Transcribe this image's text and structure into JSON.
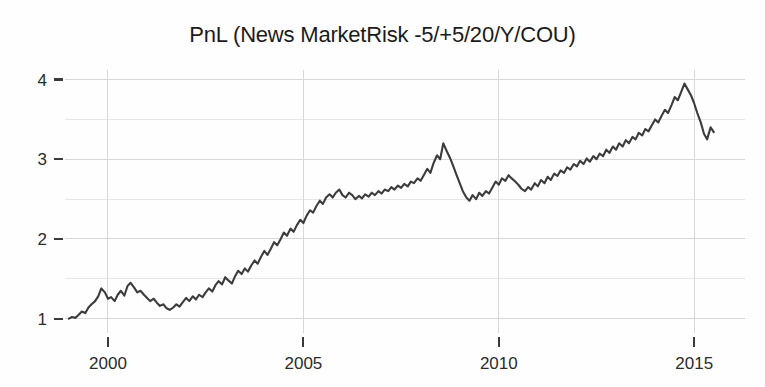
{
  "chart_data": {
    "type": "line",
    "title": "PnL (News MarketRisk -5/+5/20/Y/COU)",
    "xlabel": "",
    "ylabel": "",
    "xlim": [
      1998.9,
      2016.3
    ],
    "ylim": [
      0.82,
      4.12
    ],
    "xticks": [
      2000,
      2005,
      2010,
      2015
    ],
    "xticklabels": [
      "2000",
      "2005",
      "2010",
      "2015"
    ],
    "yticks": [
      1,
      2,
      3,
      4
    ],
    "yticklabels": [
      "1",
      "2",
      "3",
      "4"
    ],
    "minor_yticks": [
      1.5,
      2.5,
      3.5
    ],
    "grid": true,
    "grid_color": "#d8d8d8",
    "line_color": "#3c3c3c",
    "background_color": "#fefefe",
    "legend": null,
    "series": [
      {
        "name": "PnL",
        "x": [
          1999.0,
          1999.08,
          1999.17,
          1999.25,
          1999.33,
          1999.42,
          1999.5,
          1999.58,
          1999.67,
          1999.75,
          1999.83,
          1999.92,
          2000.0,
          2000.08,
          2000.17,
          2000.25,
          2000.33,
          2000.42,
          2000.5,
          2000.58,
          2000.67,
          2000.75,
          2000.83,
          2000.92,
          2001.0,
          2001.08,
          2001.17,
          2001.25,
          2001.33,
          2001.42,
          2001.5,
          2001.58,
          2001.67,
          2001.75,
          2001.83,
          2001.92,
          2002.0,
          2002.08,
          2002.17,
          2002.25,
          2002.33,
          2002.42,
          2002.5,
          2002.58,
          2002.67,
          2002.75,
          2002.83,
          2002.92,
          2003.0,
          2003.08,
          2003.17,
          2003.25,
          2003.33,
          2003.42,
          2003.5,
          2003.58,
          2003.67,
          2003.75,
          2003.83,
          2003.92,
          2004.0,
          2004.08,
          2004.17,
          2004.25,
          2004.33,
          2004.42,
          2004.5,
          2004.58,
          2004.67,
          2004.75,
          2004.83,
          2004.92,
          2005.0,
          2005.08,
          2005.17,
          2005.25,
          2005.33,
          2005.42,
          2005.5,
          2005.58,
          2005.67,
          2005.75,
          2005.83,
          2005.92,
          2006.0,
          2006.08,
          2006.17,
          2006.25,
          2006.33,
          2006.42,
          2006.5,
          2006.58,
          2006.67,
          2006.75,
          2006.83,
          2006.92,
          2007.0,
          2007.08,
          2007.17,
          2007.25,
          2007.33,
          2007.42,
          2007.5,
          2007.58,
          2007.67,
          2007.75,
          2007.83,
          2007.92,
          2008.0,
          2008.08,
          2008.17,
          2008.25,
          2008.33,
          2008.42,
          2008.5,
          2008.58,
          2008.67,
          2008.75,
          2008.83,
          2008.92,
          2009.0,
          2009.08,
          2009.17,
          2009.25,
          2009.33,
          2009.42,
          2009.5,
          2009.58,
          2009.67,
          2009.75,
          2009.83,
          2009.92,
          2010.0,
          2010.08,
          2010.17,
          2010.25,
          2010.33,
          2010.42,
          2010.5,
          2010.58,
          2010.67,
          2010.75,
          2010.83,
          2010.92,
          2011.0,
          2011.08,
          2011.17,
          2011.25,
          2011.33,
          2011.42,
          2011.5,
          2011.58,
          2011.67,
          2011.75,
          2011.83,
          2011.92,
          2012.0,
          2012.08,
          2012.17,
          2012.25,
          2012.33,
          2012.42,
          2012.5,
          2012.58,
          2012.67,
          2012.75,
          2012.83,
          2012.92,
          2013.0,
          2013.08,
          2013.17,
          2013.25,
          2013.33,
          2013.42,
          2013.5,
          2013.58,
          2013.67,
          2013.75,
          2013.83,
          2013.92,
          2014.0,
          2014.08,
          2014.17,
          2014.25,
          2014.33,
          2014.42,
          2014.5,
          2014.58,
          2014.67,
          2014.75,
          2014.83,
          2014.92,
          2015.0,
          2015.08,
          2015.17,
          2015.25,
          2015.33,
          2015.42,
          2015.5
        ],
        "y": [
          1.0,
          1.02,
          1.01,
          1.05,
          1.09,
          1.07,
          1.14,
          1.18,
          1.22,
          1.28,
          1.38,
          1.33,
          1.25,
          1.27,
          1.22,
          1.3,
          1.35,
          1.29,
          1.41,
          1.45,
          1.39,
          1.33,
          1.35,
          1.3,
          1.26,
          1.22,
          1.25,
          1.2,
          1.16,
          1.18,
          1.13,
          1.11,
          1.14,
          1.18,
          1.15,
          1.21,
          1.26,
          1.22,
          1.28,
          1.24,
          1.3,
          1.27,
          1.33,
          1.38,
          1.34,
          1.42,
          1.47,
          1.43,
          1.52,
          1.48,
          1.44,
          1.53,
          1.6,
          1.56,
          1.63,
          1.59,
          1.67,
          1.73,
          1.69,
          1.78,
          1.85,
          1.8,
          1.88,
          1.96,
          1.92,
          2.0,
          2.08,
          2.04,
          2.13,
          2.09,
          2.17,
          2.24,
          2.2,
          2.29,
          2.36,
          2.33,
          2.41,
          2.48,
          2.44,
          2.52,
          2.56,
          2.52,
          2.58,
          2.62,
          2.55,
          2.52,
          2.58,
          2.55,
          2.5,
          2.54,
          2.51,
          2.56,
          2.53,
          2.58,
          2.55,
          2.6,
          2.57,
          2.62,
          2.6,
          2.65,
          2.62,
          2.67,
          2.64,
          2.69,
          2.66,
          2.72,
          2.7,
          2.76,
          2.73,
          2.8,
          2.88,
          2.83,
          2.95,
          3.05,
          3.0,
          3.2,
          3.1,
          3.02,
          2.92,
          2.8,
          2.7,
          2.6,
          2.52,
          2.48,
          2.55,
          2.5,
          2.58,
          2.54,
          2.6,
          2.57,
          2.64,
          2.72,
          2.68,
          2.76,
          2.73,
          2.8,
          2.76,
          2.72,
          2.68,
          2.63,
          2.6,
          2.65,
          2.62,
          2.7,
          2.66,
          2.74,
          2.7,
          2.78,
          2.74,
          2.82,
          2.79,
          2.86,
          2.83,
          2.9,
          2.87,
          2.94,
          2.91,
          2.98,
          2.94,
          3.01,
          2.97,
          3.04,
          3.0,
          3.07,
          3.04,
          3.12,
          3.08,
          3.16,
          3.12,
          3.2,
          3.16,
          3.24,
          3.2,
          3.28,
          3.25,
          3.33,
          3.3,
          3.38,
          3.35,
          3.43,
          3.5,
          3.46,
          3.55,
          3.62,
          3.58,
          3.68,
          3.78,
          3.74,
          3.85,
          3.95,
          3.88,
          3.8,
          3.7,
          3.58,
          3.46,
          3.32,
          3.25,
          3.4,
          3.34
        ]
      }
    ]
  },
  "axes": {
    "plot_left": 65,
    "plot_right": 745,
    "plot_top": 70,
    "plot_bottom": 333
  }
}
